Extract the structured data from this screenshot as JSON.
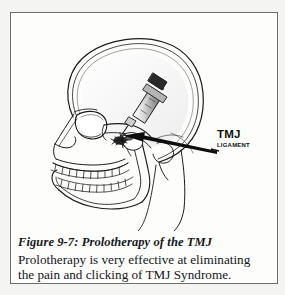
{
  "figure": {
    "illustration": {
      "name": "prolotherapy-tmj-lateral-skull-diagram",
      "description": "Lateral view line drawing of a human skull with a syringe injecting the temporomandibular joint",
      "ink_color": "#1b1b1b",
      "background_color": "#fdfdfc",
      "parts": [
        "cranium",
        "orbit",
        "nasal-bone",
        "zygomatic-arch",
        "maxilla",
        "upper-teeth",
        "lower-teeth",
        "mandible",
        "chin",
        "neck",
        "syringe",
        "needle",
        "injection-site",
        "pointer-arrow"
      ]
    },
    "callout": {
      "line1": "TMJ",
      "line2": "Ligament"
    },
    "caption": {
      "title": "Figure 9-7:  Prolotherapy of the TMJ",
      "body_line1": "Prolotherapy is very effective at eliminating",
      "body_line2": "the pain and clicking of TMJ Syndrome."
    }
  }
}
